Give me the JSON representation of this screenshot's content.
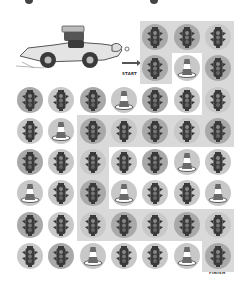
{
  "puzzle": {
    "type": "maze-path",
    "start_label": "START",
    "finish_label": "FINISH",
    "colors": {
      "path_shade": "#d9d9d9",
      "circle_light": "#c8c8c8",
      "circle_dark": "#a9a9a9",
      "icon_dark": "#3a3a3a",
      "cone_stripe": "#ffffff"
    },
    "grid": {
      "col_centers": [
        30,
        61.3,
        92.6,
        124,
        155.3,
        186.6,
        218
      ],
      "rows": [
        {
          "y": 37,
          "cells": [
            null,
            null,
            null,
            null,
            "light",
            "light",
            "light"
          ]
        },
        {
          "y": 68,
          "cells": [
            null,
            null,
            null,
            null,
            "light",
            "cone",
            "light"
          ]
        },
        {
          "y": 100,
          "cells": [
            "light",
            "light",
            "light",
            "cone",
            "light",
            "light",
            "light"
          ]
        },
        {
          "y": 131,
          "cells": [
            "light",
            "cone",
            "light",
            "light",
            "light",
            "light",
            "light"
          ]
        },
        {
          "y": 162,
          "cells": [
            "light",
            "light",
            "light",
            "light",
            "light",
            "cone",
            "light"
          ]
        },
        {
          "y": 193,
          "cells": [
            "cone",
            "light",
            "light",
            "cone",
            "light",
            "light",
            "cone"
          ]
        },
        {
          "y": 225,
          "cells": [
            "light",
            "light",
            "light",
            "light",
            "light",
            "light",
            "light"
          ]
        },
        {
          "y": 256,
          "cells": [
            "light",
            "light",
            "cone",
            "light",
            "light",
            "cone",
            "light"
          ]
        }
      ],
      "dark_circles": [
        [
          0,
          4
        ],
        [
          0,
          5
        ],
        [
          1,
          4
        ],
        [
          1,
          6
        ],
        [
          2,
          0
        ],
        [
          2,
          2
        ],
        [
          2,
          4
        ],
        [
          3,
          2
        ],
        [
          3,
          4
        ],
        [
          3,
          6
        ],
        [
          4,
          0
        ],
        [
          4,
          4
        ],
        [
          5,
          2
        ],
        [
          6,
          0
        ],
        [
          6,
          3
        ],
        [
          6,
          5
        ],
        [
          7,
          1
        ],
        [
          7,
          6
        ]
      ],
      "path_cells": [
        [
          0,
          4
        ],
        [
          0,
          5
        ],
        [
          0,
          6
        ],
        [
          1,
          4
        ],
        [
          1,
          6
        ],
        [
          2,
          6
        ],
        [
          3,
          2
        ],
        [
          3,
          3
        ],
        [
          3,
          4
        ],
        [
          3,
          5
        ],
        [
          3,
          6
        ],
        [
          4,
          2
        ],
        [
          5,
          2
        ],
        [
          6,
          2
        ],
        [
          6,
          3
        ],
        [
          6,
          4
        ],
        [
          6,
          5
        ],
        [
          6,
          6
        ],
        [
          7,
          6
        ]
      ]
    },
    "icons": {
      "traffic_light": "traffic-light-icon",
      "cone": "traffic-cone-icon",
      "car": "race-car-illustration"
    }
  }
}
